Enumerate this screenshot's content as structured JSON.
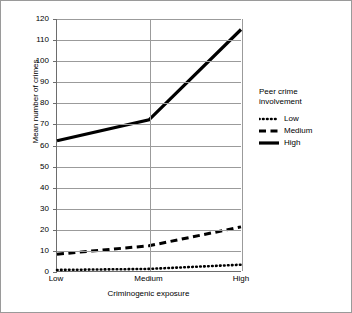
{
  "chart_data": {
    "type": "line",
    "title": "",
    "xlabel": "Criminogenic exposure",
    "ylabel": "Mean number of crimes",
    "categories": [
      "Low",
      "Medium",
      "High"
    ],
    "ylim": [
      0,
      120
    ],
    "ytick_step": 10,
    "yticks": [
      "0",
      "10",
      "20",
      "30",
      "40",
      "50",
      "60",
      "70",
      "80",
      "90",
      "100",
      "110",
      "120"
    ],
    "grid": "horizontal",
    "legend_position": "right",
    "legend_title": "Peer crime\ninvolvement",
    "series": [
      {
        "name": "Low",
        "style": "dotted",
        "color": "#000000",
        "values": [
          0.5,
          1,
          3
        ]
      },
      {
        "name": "Medium",
        "style": "dashed",
        "color": "#000000",
        "values": [
          8,
          12,
          21
        ]
      },
      {
        "name": "High",
        "style": "solid",
        "color": "#000000",
        "values": [
          62,
          72,
          115
        ]
      }
    ]
  }
}
